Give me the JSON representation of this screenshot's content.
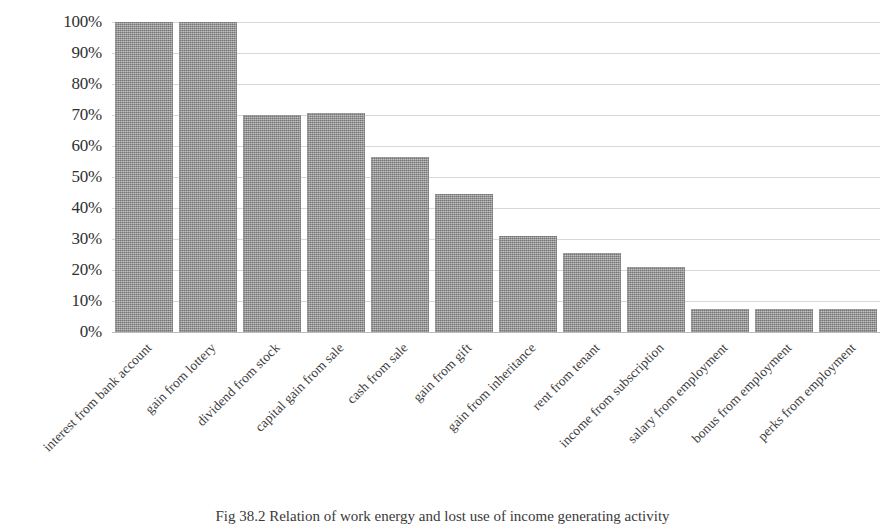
{
  "chart_data": {
    "type": "bar",
    "title": "",
    "xlabel": "",
    "ylabel": "",
    "ylim": [
      0,
      100
    ],
    "grid": true,
    "legend": "none",
    "orientation": "vertical",
    "bar_color": "#848484",
    "categories": [
      "interest from bank account",
      "gain from lottery",
      "dividend from stock",
      "capital gain from sale",
      "cash from sale",
      "gain from gift",
      "gain from inheritance",
      "rent from tenant",
      "income from subscription",
      "salary from employment",
      "bonus from employment",
      "perks from employment"
    ],
    "values": [
      100,
      100,
      70,
      70.5,
      56.5,
      44.5,
      31,
      25.5,
      21,
      7.5,
      7.5,
      7.5
    ],
    "y_ticks": [
      {
        "value": 100,
        "label": "100%"
      },
      {
        "value": 90,
        "label": "90%"
      },
      {
        "value": 80,
        "label": "80%"
      },
      {
        "value": 70,
        "label": "70%"
      },
      {
        "value": 60,
        "label": "60%"
      },
      {
        "value": 50,
        "label": "50%"
      },
      {
        "value": 40,
        "label": "40%"
      },
      {
        "value": 30,
        "label": "30%"
      },
      {
        "value": 20,
        "label": "20%"
      },
      {
        "value": 10,
        "label": "10%"
      },
      {
        "value": 0,
        "label": "0%"
      }
    ]
  },
  "caption": {
    "text": "Fig 38.2 Relation of work energy and lost use of income generating activity"
  }
}
